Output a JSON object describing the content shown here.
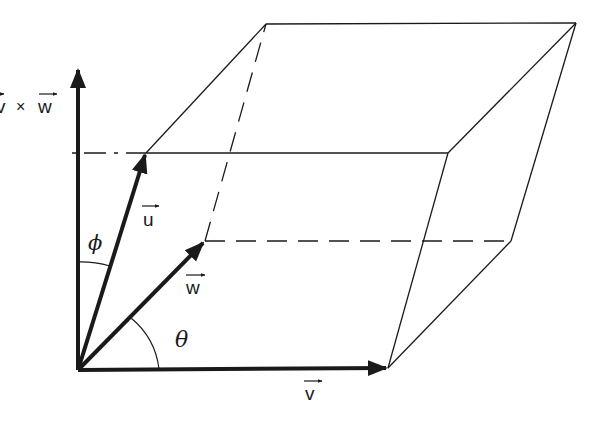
{
  "figure": {
    "background": "#ffffff",
    "stroke_color": "#1a1a1a"
  },
  "labels": {
    "cross_product": "v × w",
    "cross_v": "v",
    "cross_times": "×",
    "cross_w": "w",
    "u": "u",
    "v": "v",
    "w": "w",
    "phi": "ϕ",
    "theta": "θ",
    "arrow": "→"
  },
  "vertices": {
    "origin": [
      78,
      370
    ],
    "v": [
      388,
      368
    ],
    "u": [
      146,
      153
    ],
    "w": [
      205,
      241
    ],
    "u_plus_w": [
      266,
      24
    ],
    "u_plus_v": [
      448,
      153
    ],
    "v_plus_w": [
      511,
      241
    ],
    "u_plus_v_plus_w": [
      576,
      23
    ],
    "axis_top": [
      78,
      68
    ]
  },
  "angles": [
    {
      "name": "phi",
      "between": [
        "v×w",
        "u"
      ]
    },
    {
      "name": "theta",
      "between": [
        "v",
        "w"
      ]
    }
  ]
}
